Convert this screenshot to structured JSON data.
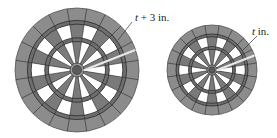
{
  "figure": {
    "large_board": {
      "label_var": "t",
      "label_rest": " + 3 in.",
      "cx": 77,
      "cy": 70,
      "r": 62
    },
    "small_board": {
      "label_var": "t",
      "label_rest": " in.",
      "cx": 212,
      "cy": 70,
      "r": 45
    },
    "colors": {
      "outer_ring": "#8c8c8c",
      "dark_sector": "#7a7a7a",
      "light_sector": "#ffffff",
      "lines": "#2a2a2a",
      "highlight": "#e8e8e8"
    },
    "segments": 20
  }
}
